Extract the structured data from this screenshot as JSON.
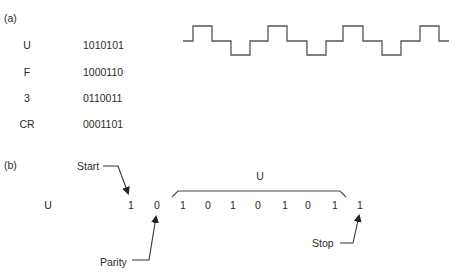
{
  "part_a": {
    "label": "(a)",
    "rows": [
      {
        "char": "U",
        "code": "1010101"
      },
      {
        "char": "F",
        "code": "1000110"
      },
      {
        "char": "3",
        "code": "0110011"
      },
      {
        "char": "CR",
        "code": "0001101"
      }
    ],
    "waveform": {
      "description": "Three-level waveform for U",
      "points": [
        [
          183,
          41
        ],
        [
          193,
          41
        ],
        [
          193,
          26
        ],
        [
          212,
          26
        ],
        [
          212,
          41
        ],
        [
          231,
          41
        ],
        [
          231,
          55
        ],
        [
          250,
          55
        ],
        [
          250,
          41
        ],
        [
          268,
          41
        ],
        [
          268,
          26
        ],
        [
          287,
          26
        ],
        [
          287,
          41
        ],
        [
          307,
          41
        ],
        [
          307,
          55
        ],
        [
          326,
          55
        ],
        [
          326,
          41
        ],
        [
          343,
          41
        ],
        [
          343,
          26
        ],
        [
          363,
          26
        ],
        [
          363,
          41
        ],
        [
          382,
          41
        ],
        [
          382,
          55
        ],
        [
          401,
          55
        ],
        [
          401,
          41
        ],
        [
          420,
          41
        ],
        [
          420,
          26
        ],
        [
          439,
          26
        ],
        [
          439,
          41
        ],
        [
          449,
          41
        ]
      ]
    }
  },
  "part_b": {
    "label": "(b)",
    "char": "U",
    "start_label": "Start",
    "parity_label": "Parity",
    "stop_label": "Stop",
    "bracket_label": "U",
    "start_bit": "1",
    "parity_bit": "0",
    "data_bits": [
      "1",
      "0",
      "1",
      "0",
      "1",
      "0",
      "1"
    ],
    "stop_bit": "1"
  },
  "colors": {
    "text": "#2b2b2b",
    "line": "#555555"
  }
}
